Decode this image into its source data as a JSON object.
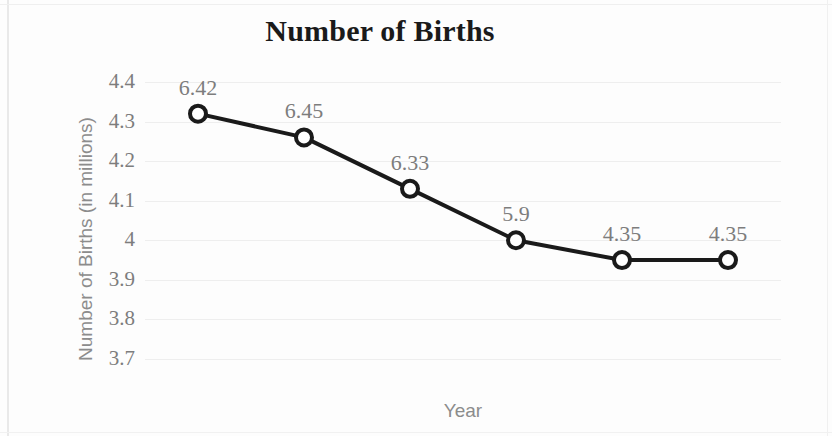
{
  "chart_data": {
    "type": "line",
    "title": "Number of Births",
    "xlabel": "Year",
    "ylabel": "Number of Births (in millions)",
    "categories": [
      "2007",
      "2008",
      "2009",
      "2010",
      "2011",
      "2012"
    ],
    "values": [
      4.32,
      4.26,
      4.13,
      4.0,
      3.95,
      3.95
    ],
    "point_labels": [
      "6.42",
      "6.45",
      "6.33",
      "5.9",
      "4.35",
      "4.35"
    ],
    "ylim": [
      3.7,
      4.4
    ],
    "ytick_labels": [
      "4.4",
      "4.3",
      "4.2",
      "4.1",
      "4",
      "3.9",
      "3.8",
      "3.7"
    ],
    "ytick_values": [
      4.4,
      4.3,
      4.2,
      4.1,
      4.0,
      3.9,
      3.8,
      3.7
    ],
    "grid": true,
    "legend": false,
    "series_color": "#1a1a1a",
    "marker_fill": "#ffffff",
    "grid_color": "#eeeeee",
    "tick_text_color": "#7d7d7d",
    "axis_title_color": "#8c8c8c",
    "title_color": "#1a1a1a"
  }
}
